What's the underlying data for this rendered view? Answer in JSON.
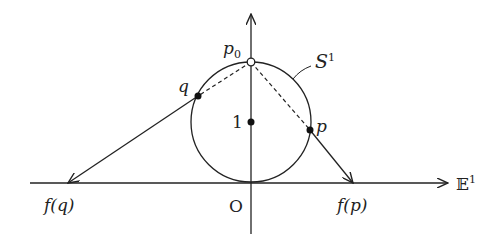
{
  "diagram": {
    "labels": {
      "p0": "p",
      "p0_sub": "0",
      "S": "S",
      "S_sup": "1",
      "q": "q",
      "p": "p",
      "one": "1",
      "origin": "O",
      "fq": "f(q)",
      "fp": "f(p)",
      "E": "𝔼",
      "E_sup": "1"
    },
    "colors": {
      "stroke": "#222222",
      "background": "#ffffff"
    }
  }
}
